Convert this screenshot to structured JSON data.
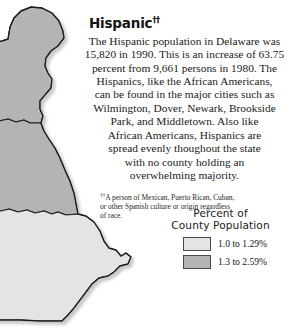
{
  "title": {
    "text": "Hispanic",
    "footnote_marker": "††"
  },
  "body": {
    "lines": [
      "The Hispanic population in Delaware was",
      "15,820 in 1990. This is an increase of 63.75",
      "percent from 9,661 persons in 1980. The",
      "Hispanics, like the African Americans,",
      "can be found in the major cities such as",
      "Wilmington, Dover, Newark, Brookside",
      "Park, and Middletown. Also like",
      "African Americans, Hispanics are",
      "spread evenly thoughout the state",
      "with no county holding an",
      "overwhelming majority."
    ]
  },
  "footnote": {
    "marker": "††",
    "lines": [
      "A person of Mexican, Puerto Rican, Cuban,",
      "or other Spanish culture or origin regardless",
      "of race."
    ]
  },
  "legend": {
    "title_line1": "Percent of",
    "title_line2": "County Population",
    "items": [
      {
        "label": "1.0 to 1.29%",
        "color": "#e4e4e4",
        "swatch_class": "light"
      },
      {
        "label": "1.3 to 2.59%",
        "color": "#b4b4b4",
        "swatch_class": "dark"
      }
    ]
  },
  "map": {
    "name": "delaware-county-choropleth",
    "state": "Delaware",
    "outline_color": "#1c1c1c",
    "counties": [
      {
        "name": "New Castle",
        "fill": "#b4b4b4",
        "class": "dark"
      },
      {
        "name": "Kent",
        "fill": "#b4b4b4",
        "class": "dark"
      },
      {
        "name": "Sussex",
        "fill": "#e4e4e4",
        "class": "light"
      }
    ]
  }
}
